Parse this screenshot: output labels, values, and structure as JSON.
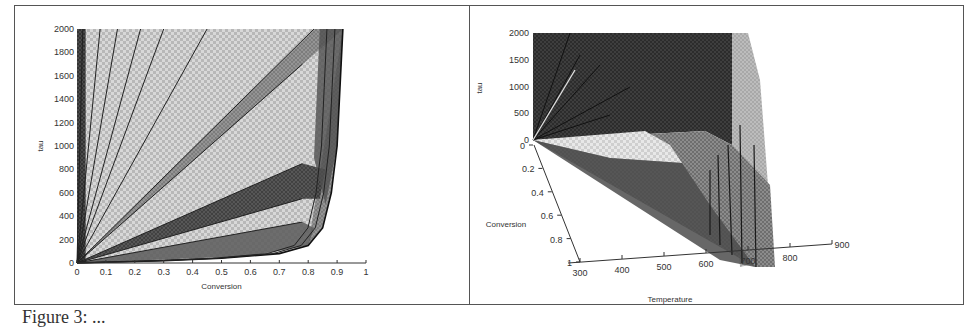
{
  "figure": {
    "caption_visible": "Figure 3: ...",
    "panels": [
      "left-2d-plot",
      "right-3d-plot"
    ]
  },
  "chart_data": [
    {
      "type": "area",
      "title": "",
      "xlabel": "Conversion",
      "ylabel": "tau",
      "xlim": [
        0,
        1
      ],
      "ylim": [
        0,
        2000
      ],
      "x_ticks": [
        "0",
        "0.1",
        "0.2",
        "0.3",
        "0.4",
        "0.5",
        "0.6",
        "0.7",
        "0.8",
        "0.9",
        "1"
      ],
      "y_ticks": [
        "0",
        "200",
        "400",
        "600",
        "800",
        "1000",
        "1200",
        "1400",
        "1600",
        "1800",
        "2000"
      ],
      "grid": false,
      "legend": null,
      "description": "Overlapping shaded regions fanning from origin; many linear rays (tau proportional to conversion) and an envelope curve that rises steeply near conversion ≈ 0.9",
      "series": [
        {
          "name": "envelope",
          "x": [
            0,
            0.3,
            0.5,
            0.7,
            0.8,
            0.85,
            0.88,
            0.9,
            0.91,
            0.92
          ],
          "y": [
            0,
            20,
            40,
            80,
            150,
            300,
            600,
            1000,
            1500,
            2000
          ]
        },
        {
          "name": "ray-1",
          "x": [
            0,
            0.02
          ],
          "y": [
            0,
            2000
          ]
        },
        {
          "name": "ray-2",
          "x": [
            0,
            0.08
          ],
          "y": [
            0,
            2000
          ]
        },
        {
          "name": "ray-3",
          "x": [
            0,
            0.14
          ],
          "y": [
            0,
            2000
          ]
        },
        {
          "name": "ray-4",
          "x": [
            0,
            0.22
          ],
          "y": [
            0,
            2000
          ]
        },
        {
          "name": "ray-5",
          "x": [
            0,
            0.3
          ],
          "y": [
            0,
            2000
          ]
        },
        {
          "name": "ray-6",
          "x": [
            0,
            0.45
          ],
          "y": [
            0,
            2000
          ]
        },
        {
          "name": "ray-7",
          "x": [
            0,
            0.82
          ],
          "y": [
            0,
            2000
          ]
        },
        {
          "name": "ray-8",
          "x": [
            0,
            0.78
          ],
          "y": [
            0,
            1700
          ]
        },
        {
          "name": "ray-9",
          "x": [
            0,
            0.78
          ],
          "y": [
            0,
            850
          ]
        },
        {
          "name": "ray-10",
          "x": [
            0,
            0.78
          ],
          "y": [
            0,
            550
          ]
        },
        {
          "name": "ray-11",
          "x": [
            0,
            0.78
          ],
          "y": [
            0,
            350
          ]
        }
      ]
    },
    {
      "type": "surface3d",
      "title": "",
      "xlabel": "Temperature",
      "ylabel": "Conversion",
      "zlabel": "tau",
      "xlim": [
        300,
        900
      ],
      "ylim": [
        0,
        1
      ],
      "zlim": [
        0,
        2000
      ],
      "x_ticks": [
        "300",
        "400",
        "500",
        "600",
        "700",
        "800",
        "900"
      ],
      "y_ticks": [
        "0",
        "0.2",
        "0.4",
        "0.6",
        "0.8",
        "1"
      ],
      "z_ticks": [
        "0",
        "500",
        "1000",
        "1500",
        "2000"
      ],
      "grid": false,
      "legend": null,
      "description": "3D shaded polyhedral region of tau over Temperature and Conversion; tall dark face rising near low conversion, bounded around temperature ≈ 800-850"
    }
  ]
}
